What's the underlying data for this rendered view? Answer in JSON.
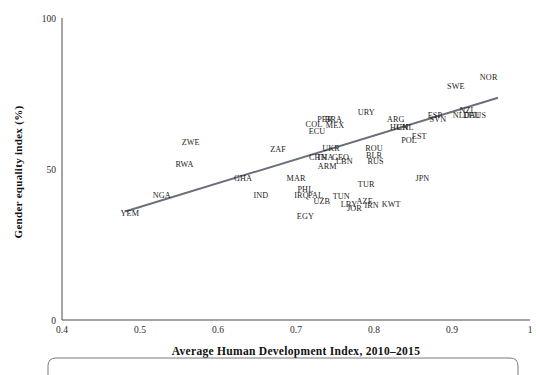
{
  "figure": {
    "background_color": "#ffffff",
    "axis_color": "#4a4a4a",
    "label_color": "#1c1c1c",
    "trend_color": "#6b6f7a"
  },
  "chart_data": {
    "type": "scatter",
    "title": "",
    "xlabel": "Average Human Development Index, 2010–2015",
    "ylabel": "Gender equality index (%)",
    "xlim": [
      0.4,
      1
    ],
    "ylim": [
      0,
      100
    ],
    "xticks": [
      0.4,
      0.5,
      0.6,
      0.7,
      0.8,
      0.9,
      1
    ],
    "xticklabels": [
      "0.4",
      "0.5",
      "0.6",
      "0.7",
      "0.8",
      "0.9",
      "1"
    ],
    "yticks": [
      0,
      50,
      100
    ],
    "yticklabels": [
      "0",
      "50",
      "100"
    ],
    "grid": false,
    "legend": "none",
    "point_marker": "label-only",
    "trend": {
      "type": "linear-fit",
      "x": [
        0.482,
        0.958
      ],
      "y": [
        36.0,
        73.5
      ],
      "color": "#6b6f7a"
    },
    "points": [
      {
        "label": "ZWE",
        "x": 0.565,
        "y": 58.0
      },
      {
        "label": "RWA",
        "x": 0.557,
        "y": 50.5
      },
      {
        "label": "GHA",
        "x": 0.632,
        "y": 46.0
      },
      {
        "label": "MAR",
        "x": 0.7,
        "y": 46.0
      },
      {
        "label": "ZAF",
        "x": 0.677,
        "y": 55.5
      },
      {
        "label": "NGA",
        "x": 0.528,
        "y": 40.5
      },
      {
        "label": "YEM",
        "x": 0.487,
        "y": 34.5
      },
      {
        "label": "IND",
        "x": 0.655,
        "y": 40.5
      },
      {
        "label": "PHL",
        "x": 0.712,
        "y": 42.5
      },
      {
        "label": "IRQ",
        "x": 0.707,
        "y": 40.5
      },
      {
        "label": "PAL",
        "x": 0.725,
        "y": 40.5
      },
      {
        "label": "UZB",
        "x": 0.733,
        "y": 38.5
      },
      {
        "label": "EGY",
        "x": 0.712,
        "y": 33.5
      },
      {
        "label": "TUN",
        "x": 0.758,
        "y": 40.0
      },
      {
        "label": "LBY",
        "x": 0.768,
        "y": 37.5
      },
      {
        "label": "JOR",
        "x": 0.775,
        "y": 36.0
      },
      {
        "label": "AZE",
        "x": 0.788,
        "y": 38.5
      },
      {
        "label": "IRN",
        "x": 0.797,
        "y": 37.0
      },
      {
        "label": "KWT",
        "x": 0.822,
        "y": 37.5
      },
      {
        "label": "TUR",
        "x": 0.79,
        "y": 44.0
      },
      {
        "label": "ARM",
        "x": 0.74,
        "y": 50.0
      },
      {
        "label": "LBN",
        "x": 0.762,
        "y": 51.5
      },
      {
        "label": "CHN",
        "x": 0.728,
        "y": 53.0
      },
      {
        "label": "THA",
        "x": 0.737,
        "y": 53.0
      },
      {
        "label": "GEO",
        "x": 0.757,
        "y": 53.0
      },
      {
        "label": "UKR",
        "x": 0.745,
        "y": 56.0
      },
      {
        "label": "ROU",
        "x": 0.8,
        "y": 56.0
      },
      {
        "label": "BLR",
        "x": 0.8,
        "y": 53.5
      },
      {
        "label": "RUS",
        "x": 0.802,
        "y": 51.5
      },
      {
        "label": "ECU",
        "x": 0.727,
        "y": 61.5
      },
      {
        "label": "COL",
        "x": 0.723,
        "y": 64.0
      },
      {
        "label": "PER",
        "x": 0.737,
        "y": 65.5
      },
      {
        "label": "BRA",
        "x": 0.748,
        "y": 65.5
      },
      {
        "label": "MEX",
        "x": 0.75,
        "y": 63.5
      },
      {
        "label": "URY",
        "x": 0.79,
        "y": 68.0
      },
      {
        "label": "ARG",
        "x": 0.828,
        "y": 65.5
      },
      {
        "label": "HUN",
        "x": 0.832,
        "y": 63.0
      },
      {
        "label": "CHL",
        "x": 0.84,
        "y": 63.0
      },
      {
        "label": "POL",
        "x": 0.845,
        "y": 58.5
      },
      {
        "label": "EST",
        "x": 0.858,
        "y": 60.0
      },
      {
        "label": "ESP",
        "x": 0.878,
        "y": 67.0
      },
      {
        "label": "SVN",
        "x": 0.882,
        "y": 65.5
      },
      {
        "label": "NLD",
        "x": 0.912,
        "y": 67.0
      },
      {
        "label": "NZL",
        "x": 0.92,
        "y": 68.5
      },
      {
        "label": "DEU",
        "x": 0.925,
        "y": 67.0
      },
      {
        "label": "AUS",
        "x": 0.933,
        "y": 67.0
      },
      {
        "label": "SWE",
        "x": 0.905,
        "y": 76.5
      },
      {
        "label": "NOR",
        "x": 0.947,
        "y": 79.5
      },
      {
        "label": "JPN",
        "x": 0.862,
        "y": 46.0
      }
    ]
  }
}
